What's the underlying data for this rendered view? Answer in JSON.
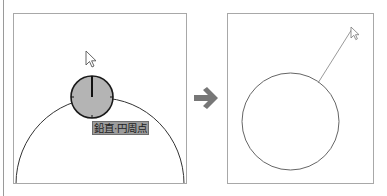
{
  "diagram": {
    "left_panel": {
      "label": "鉛直·円周点",
      "snap_marker": {
        "fill": "#b4b4b4",
        "stroke": "#1a1a1a"
      },
      "arc_color": "#333333",
      "cursor": "arrow-cursor"
    },
    "transition_arrow": {
      "icon": "right-arrow-icon",
      "color": "#777777"
    },
    "right_panel": {
      "circle_color": "#666666",
      "rubber_band_line_color": "#9a9a9a",
      "cursor": "arrow-cursor"
    }
  }
}
